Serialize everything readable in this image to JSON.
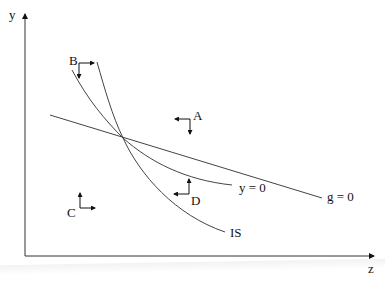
{
  "axes": {
    "y_label": "y",
    "x_label": "z"
  },
  "curves": {
    "g_line": {
      "label": "g = 0"
    },
    "y_curve": {
      "label": "y = 0"
    },
    "is_curve": {
      "label": "IS"
    }
  },
  "regions": {
    "A": {
      "label": "A",
      "arrows": [
        "left",
        "down"
      ]
    },
    "B": {
      "label": "B",
      "arrows": [
        "right",
        "down"
      ]
    },
    "C": {
      "label": "C",
      "arrows": [
        "right",
        "up"
      ]
    },
    "D": {
      "label": "D",
      "arrows": [
        "left",
        "up"
      ]
    }
  },
  "colors": {
    "ink": "#222222",
    "line": "#555555"
  }
}
